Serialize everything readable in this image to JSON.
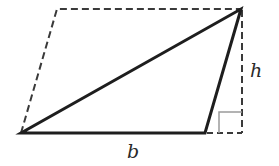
{
  "diagram": {
    "labels": {
      "base": "b",
      "height": "h"
    },
    "colors": {
      "solid_stroke": "#1e1e1e",
      "dashed_stroke": "#3a3a3a",
      "right_angle_marker": "#9a9a9a",
      "background": "#ffffff"
    },
    "shapes": {
      "triangle": {
        "vertices": [
          [
            21,
            133
          ],
          [
            205,
            133
          ],
          [
            241,
            9
          ]
        ]
      },
      "parallelogram_dashed": {
        "vertices": [
          [
            21,
            133
          ],
          [
            57,
            9
          ],
          [
            241,
            9
          ]
        ]
      },
      "height_line_dashed": {
        "from": [
          242,
          9
        ],
        "to": [
          242,
          133
        ]
      },
      "base_extension_dashed": {
        "from": [
          205,
          133
        ],
        "to": [
          242,
          133
        ]
      },
      "right_angle_marker": {
        "corner": [
          242,
          133
        ],
        "size": 22
      }
    }
  }
}
